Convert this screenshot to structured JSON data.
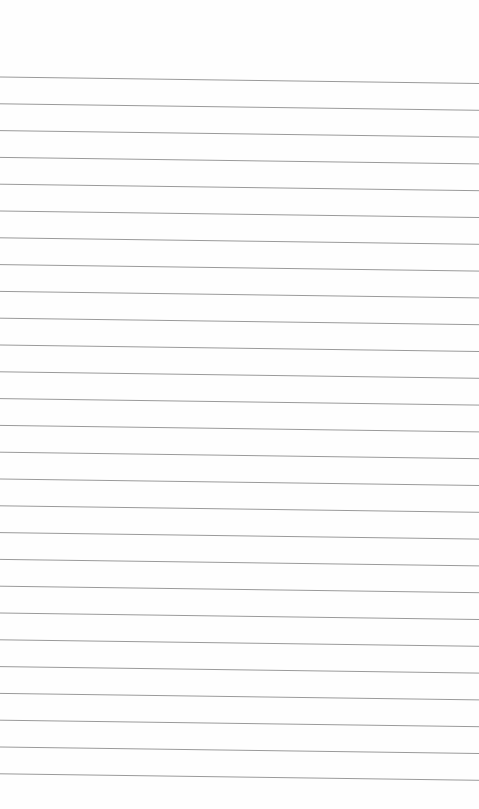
{
  "page": {
    "type": "lined-paper",
    "background_color": "#fefefe",
    "rule_color": "#9a9a9a",
    "rule_count": 27,
    "first_rule_y_left": 77,
    "rule_spacing": 26.8,
    "rule_slope_px": 6.5,
    "text_content": []
  }
}
